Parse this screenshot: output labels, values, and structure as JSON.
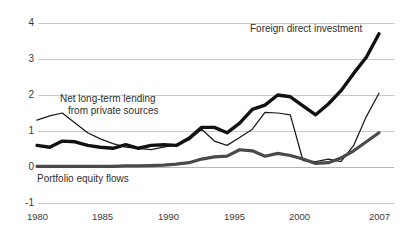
{
  "chart_data": {
    "type": "line",
    "title": "",
    "subtitle": "",
    "xlabel": "",
    "ylabel": "",
    "grid": true,
    "legend_position": "inline-annotations",
    "x": [
      1980,
      1981,
      1982,
      1983,
      1984,
      1985,
      1986,
      1987,
      1988,
      1989,
      1990,
      1991,
      1992,
      1993,
      1994,
      1995,
      1996,
      1997,
      1998,
      1999,
      2000,
      2001,
      2002,
      2003,
      2004,
      2005,
      2006,
      2007
    ],
    "xlim": [
      1980,
      2007
    ],
    "ylim": [
      -1,
      4
    ],
    "yticks": [
      -1,
      0,
      1,
      2,
      3,
      4
    ],
    "xticks": [
      1980,
      1985,
      1990,
      1995,
      2000,
      2007
    ],
    "xtick_labels": [
      "1980",
      "1985",
      "1990",
      "1995",
      "2000",
      "2007"
    ],
    "ytick_labels": [
      "-1",
      "0",
      "1",
      "2",
      "3",
      "4"
    ],
    "series": [
      {
        "name": "Foreign direct investment",
        "style": "thick-black",
        "color": "#111111",
        "values": [
          0.6,
          0.55,
          0.72,
          0.7,
          0.6,
          0.55,
          0.52,
          0.62,
          0.52,
          0.6,
          0.62,
          0.6,
          0.8,
          1.1,
          1.1,
          0.95,
          1.22,
          1.6,
          1.72,
          2.0,
          1.95,
          1.7,
          1.45,
          1.75,
          2.12,
          2.6,
          3.05,
          3.7
        ]
      },
      {
        "name": "Net long-term lending from private sources",
        "style": "thin-black",
        "color": "#1b1b1b",
        "values": [
          1.3,
          1.42,
          1.5,
          1.22,
          0.95,
          0.78,
          0.65,
          0.55,
          0.52,
          0.48,
          0.55,
          0.62,
          0.75,
          1.05,
          0.72,
          0.6,
          0.82,
          1.05,
          1.52,
          1.5,
          1.45,
          0.18,
          0.15,
          0.22,
          0.15,
          0.6,
          1.4,
          2.05
        ]
      },
      {
        "name": "Portfolio equity flows",
        "style": "thick-gray",
        "color": "#4a4a4a",
        "values": [
          0.02,
          0.02,
          0.02,
          0.02,
          0.02,
          0.02,
          0.02,
          0.03,
          0.03,
          0.04,
          0.05,
          0.08,
          0.12,
          0.22,
          0.28,
          0.3,
          0.48,
          0.45,
          0.3,
          0.38,
          0.32,
          0.22,
          0.1,
          0.12,
          0.25,
          0.45,
          0.7,
          0.95
        ]
      }
    ],
    "annotations": [
      {
        "name": "annotation-lending",
        "text": "Net long-term lending\nfrom private sources"
      },
      {
        "name": "annotation-fdi",
        "text": "Foreign direct investment"
      },
      {
        "name": "annotation-portfolio",
        "text": "Portfolio equity flows"
      }
    ],
    "annotation_texts": {
      "lending_line1": "Net long-term lending",
      "lending_line2": "from private sources",
      "fdi": "Foreign direct investment",
      "portfolio": "Portfolio equity flows"
    },
    "colors": {
      "fdi": "#111111",
      "lending": "#1b1b1b",
      "portfolio": "#4a4a4a",
      "grid": "#c9c9c9",
      "background": "#ffffff",
      "text": "#2b2b2b"
    }
  }
}
